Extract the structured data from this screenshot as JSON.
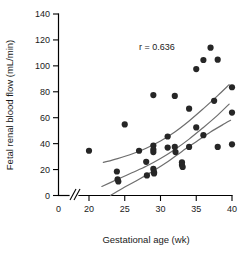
{
  "chart_data": {
    "type": "scatter",
    "title": "",
    "xlabel": "Gestational age (wk)",
    "ylabel": "Fetal renal blood flow (mL/min)",
    "xlim": [
      19,
      40
    ],
    "ylim": [
      0,
      140
    ],
    "xticks": [
      0,
      20,
      25,
      30,
      35,
      40
    ],
    "yticks": [
      0,
      20,
      40,
      60,
      80,
      100,
      120,
      140
    ],
    "xtick_labels": [
      "0",
      "20",
      "25",
      "30",
      "35",
      "40"
    ],
    "ytick_labels": [
      "0",
      "20",
      "40",
      "60",
      "80",
      "100",
      "120",
      "140"
    ],
    "axis_break": {
      "axis": "x",
      "glyph": "//",
      "between": [
        0,
        20
      ]
    },
    "grid": false,
    "legend": false,
    "annotations": [
      {
        "name": "correlation-coefficient",
        "text": "r = 0.636",
        "x": 27.0,
        "y": 112
      }
    ],
    "series": [
      {
        "name": "Fetal renal blood flow",
        "marker": "filled-circle",
        "color": "#262626",
        "points": [
          [
            20.0,
            34.5
          ],
          [
            23.9,
            18.5
          ],
          [
            24.0,
            12.5
          ],
          [
            24.1,
            10.8
          ],
          [
            25.0,
            54.8
          ],
          [
            27.0,
            34.5
          ],
          [
            28.0,
            26.0
          ],
          [
            28.1,
            15.5
          ],
          [
            29.0,
            77.5
          ],
          [
            29.0,
            38.5
          ],
          [
            29.0,
            35.5
          ],
          [
            29.0,
            33.5
          ],
          [
            29.0,
            20.5
          ],
          [
            29.1,
            18.0
          ],
          [
            29.1,
            17.0
          ],
          [
            31.0,
            45.5
          ],
          [
            31.0,
            37.0
          ],
          [
            32.0,
            76.8
          ],
          [
            32.0,
            37.5
          ],
          [
            32.1,
            33.5
          ],
          [
            33.0,
            25.5
          ],
          [
            33.0,
            23.5
          ],
          [
            33.1,
            22.0
          ],
          [
            34.0,
            67.0
          ],
          [
            34.0,
            37.5
          ],
          [
            35.0,
            97.5
          ],
          [
            35.0,
            52.5
          ],
          [
            36.0,
            104.5
          ],
          [
            36.0,
            46.5
          ],
          [
            37.0,
            114.0
          ],
          [
            37.5,
            73.0
          ],
          [
            38.0,
            104.8
          ],
          [
            38.0,
            37.5
          ],
          [
            40.0,
            83.5
          ],
          [
            40.0,
            64.0
          ],
          [
            40.0,
            39.5
          ]
        ]
      }
    ],
    "fit_curves": [
      {
        "name": "upper-confidence-band",
        "color": "#6e6e6e",
        "points": [
          [
            22.0,
            25.5
          ],
          [
            24.0,
            28.5
          ],
          [
            26.0,
            32.0
          ],
          [
            28.0,
            36.5
          ],
          [
            30.0,
            42.0
          ],
          [
            32.0,
            49.0
          ],
          [
            34.0,
            57.5
          ],
          [
            36.0,
            67.0
          ],
          [
            38.0,
            77.0
          ],
          [
            39.6,
            85.5
          ]
        ]
      },
      {
        "name": "regression-line",
        "color": "#6e6e6e",
        "points": [
          [
            21.8,
            7.0
          ],
          [
            24.0,
            12.5
          ],
          [
            26.0,
            17.5
          ],
          [
            28.0,
            22.5
          ],
          [
            30.0,
            28.5
          ],
          [
            32.0,
            35.5
          ],
          [
            34.0,
            43.5
          ],
          [
            36.0,
            52.5
          ],
          [
            38.0,
            62.0
          ],
          [
            39.6,
            70.5
          ]
        ]
      },
      {
        "name": "lower-confidence-band",
        "color": "#6e6e6e",
        "points": [
          [
            23.0,
            0.0
          ],
          [
            25.0,
            6.5
          ],
          [
            27.0,
            12.5
          ],
          [
            29.0,
            19.0
          ],
          [
            31.0,
            26.0
          ],
          [
            33.0,
            34.0
          ],
          [
            35.0,
            41.5
          ],
          [
            37.0,
            49.0
          ],
          [
            39.0,
            55.5
          ],
          [
            39.8,
            58.0
          ]
        ]
      }
    ]
  }
}
